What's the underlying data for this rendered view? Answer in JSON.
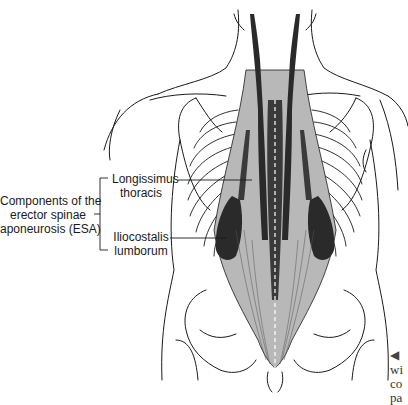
{
  "figure": {
    "colors": {
      "outline": "#1a1a1a",
      "muscle_light": "#b8b8b8",
      "muscle_dark": "#2a2a2a",
      "background": "#ffffff"
    }
  },
  "labels": {
    "group": {
      "line1": "Components of the",
      "line2": "erector spinae",
      "line3": "aponeurosis (ESA)"
    },
    "longissimus": {
      "line1": "Longissimus",
      "line2": "thoracis"
    },
    "iliocostalis": {
      "line1": "Iliocostalis",
      "line2": "lumborum"
    }
  },
  "caption_fragment": {
    "arrow": "◀",
    "line1": "wi",
    "line2": "co",
    "line3": "pa"
  }
}
